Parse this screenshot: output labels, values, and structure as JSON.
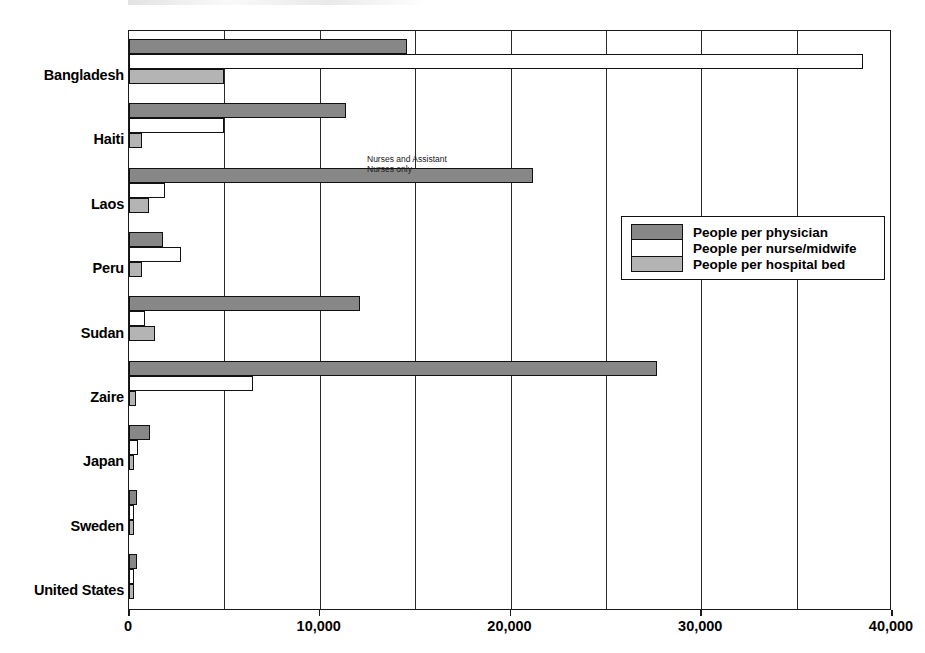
{
  "chart_data": {
    "type": "bar",
    "orientation": "horizontal",
    "title": "",
    "xlabel": "",
    "ylabel": "",
    "xlim": [
      0,
      40000
    ],
    "xticks": [
      0,
      10000,
      20000,
      30000,
      40000
    ],
    "xtick_labels": [
      "0",
      "10,000",
      "20,000",
      "30,000",
      "40,000"
    ],
    "gridlines": [
      5000,
      10000,
      15000,
      20000,
      25000,
      30000,
      35000
    ],
    "grid": true,
    "legend_position": "middle-right",
    "categories": [
      "Bangladesh",
      "Haiti",
      "Laos",
      "Peru",
      "Sudan",
      "Zaire",
      "Japan",
      "Sweden",
      "United States"
    ],
    "series": [
      {
        "name": "People per physician",
        "color": "#878787",
        "values": [
          14600,
          11400,
          21200,
          1800,
          12100,
          27700,
          1100,
          410,
          420
        ]
      },
      {
        "name": "People per nurse/midwife",
        "color": "#ffffff",
        "values": [
          38500,
          5000,
          1900,
          2700,
          850,
          6500,
          450,
          130,
          100
        ]
      },
      {
        "name": "People per hospital bed",
        "color": "#b4b4b4",
        "values": [
          5000,
          700,
          1050,
          700,
          1350,
          350,
          100,
          180,
          200
        ]
      }
    ],
    "annotations": [
      {
        "text": "Nurses and Assistant\nNurses only",
        "target_category": "Haiti",
        "target_series": "People per nurse/midwife"
      }
    ]
  },
  "legend": {
    "entries": [
      {
        "label": "People per physician",
        "swatch": "physician"
      },
      {
        "label": "People per nurse/midwife",
        "swatch": "nurse"
      },
      {
        "label": "People per hospital bed",
        "swatch": "bed"
      }
    ]
  },
  "axis": {
    "x_tick_labels": [
      "0",
      "10,000",
      "20,000",
      "30,000",
      "40,000"
    ]
  },
  "annotation": {
    "text": "Nurses and Assistant\nNurses only"
  }
}
